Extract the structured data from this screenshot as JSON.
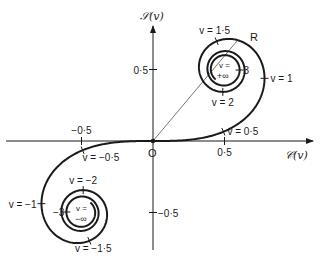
{
  "diagram": {
    "origin_px": [
      153,
      141
    ],
    "scale_px_per_unit": 143,
    "colors": {
      "ink": "#1a1a1a",
      "background": "#ffffff"
    },
    "axes": {
      "x_label": "𝒞(v)",
      "y_label": "𝒮(v)",
      "origin_label": "O",
      "x_ticks": [
        {
          "value": -0.5,
          "label": "−0·5"
        },
        {
          "value": 0.5,
          "label": "0·5"
        }
      ],
      "y_ticks": [
        {
          "value": 0.5,
          "label": "0·5"
        },
        {
          "value": -0.5,
          "label": "−0·5"
        }
      ]
    },
    "curve": {
      "description": "Fresnel integrals C(v), S(v) for v from -∞ to +∞",
      "v_range": [
        -3.4,
        3.4
      ],
      "limit_points": [
        {
          "C": 0.5,
          "S": 0.5,
          "label_top": "v =",
          "label_bottom": "+∞"
        },
        {
          "C": -0.5,
          "S": -0.5,
          "label_top": "v =",
          "label_bottom": "−∞"
        }
      ]
    },
    "v_markers": [
      {
        "v": 0.5,
        "label": "v = 0·5",
        "dx": 4,
        "dy": 3,
        "anchor": "start"
      },
      {
        "v": 1,
        "label": "v = 1",
        "dx": 6,
        "dy": 4,
        "anchor": "start"
      },
      {
        "v": 1.5,
        "label": "v = 1·5",
        "dx": -2,
        "dy": -7,
        "anchor": "middle"
      },
      {
        "v": 2,
        "label": "v = 2",
        "dx": 0,
        "dy": 14,
        "anchor": "middle"
      },
      {
        "v": 3,
        "label": "3",
        "dx": 4,
        "dy": 4,
        "anchor": "start"
      },
      {
        "v": -0.5,
        "label": "v = −0·5",
        "dx": 0,
        "dy": 11,
        "anchor": "start"
      },
      {
        "v": -1,
        "label": "v = −1",
        "dx": -5,
        "dy": 4,
        "anchor": "end"
      },
      {
        "v": -1.5,
        "label": "v = −1·5",
        "dx": 4,
        "dy": 11,
        "anchor": "middle"
      },
      {
        "v": -2,
        "label": "v = −2",
        "dx": 0,
        "dy": -6,
        "anchor": "middle"
      },
      {
        "v": -3,
        "label": "−3",
        "dx": -2,
        "dy": 4,
        "anchor": "end"
      }
    ],
    "chord": {
      "from": "O",
      "to_v": 1.35,
      "label": "R"
    }
  }
}
